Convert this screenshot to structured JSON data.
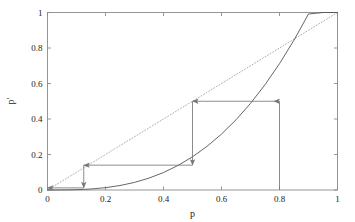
{
  "chart_data": {
    "type": "line",
    "title": "",
    "subtitle": "",
    "xlabel": "p",
    "ylabel": "p'",
    "xlim": [
      0,
      1
    ],
    "ylim": [
      0,
      1
    ],
    "grid": false,
    "legend": "none",
    "xticks": [
      {
        "value": 0,
        "label": "0"
      },
      {
        "value": 0.2,
        "label": "0.2"
      },
      {
        "value": 0.4,
        "label": "0.4"
      },
      {
        "value": 0.6,
        "label": "0.6"
      },
      {
        "value": 0.8,
        "label": "0.8"
      },
      {
        "value": 1,
        "label": "1"
      }
    ],
    "yticks": [
      {
        "value": 0,
        "label": "0"
      },
      {
        "value": 0.2,
        "label": "0.2"
      },
      {
        "value": 0.4,
        "label": "0.4"
      },
      {
        "value": 0.6,
        "label": "0.6"
      },
      {
        "value": 0.8,
        "label": "0.8"
      },
      {
        "value": 1,
        "label": "1"
      }
    ],
    "series": [
      {
        "name": "identity-line",
        "style": "dotted",
        "color": "#999999",
        "x": [
          0,
          1
        ],
        "values": [
          0,
          1
        ]
      },
      {
        "name": "map-curve",
        "style": "solid",
        "color": "#555555",
        "x": [
          0,
          0.05,
          0.1,
          0.125,
          0.15,
          0.2,
          0.25,
          0.3,
          0.35,
          0.4,
          0.45,
          0.5,
          0.55,
          0.6,
          0.65,
          0.7,
          0.75,
          0.8,
          0.85,
          0.9,
          0.95,
          1
        ],
        "values": [
          0,
          0.0003,
          0.0018,
          0.0034,
          0.0057,
          0.0132,
          0.0252,
          0.0428,
          0.0669,
          0.0985,
          0.1383,
          0.1871,
          0.2458,
          0.315,
          0.3955,
          0.488,
          0.5932,
          0.7117,
          0.8443,
          0.9915,
          1.0,
          1.0
        ]
      }
    ],
    "cobweb": {
      "color": "#777777",
      "start": {
        "x": 0.8,
        "y": 0.0
      },
      "steps": [
        {
          "kind": "vertical",
          "x": 0.8,
          "from_y": 0.0,
          "to_y": 0.5,
          "arrow": "up"
        },
        {
          "kind": "horizontal",
          "y": 0.5,
          "from_x": 0.8,
          "to_x": 0.5,
          "arrow": "left"
        },
        {
          "kind": "vertical",
          "x": 0.5,
          "from_y": 0.5,
          "to_y": 0.14,
          "arrow": "down"
        },
        {
          "kind": "horizontal",
          "y": 0.14,
          "from_x": 0.5,
          "to_x": 0.125,
          "arrow": "left"
        },
        {
          "kind": "vertical",
          "x": 0.125,
          "from_y": 0.14,
          "to_y": 0.012,
          "arrow": "down"
        },
        {
          "kind": "horizontal",
          "y": 0.012,
          "from_x": 0.125,
          "to_x": 0.0,
          "arrow": "left"
        }
      ]
    },
    "frame": {
      "border": true,
      "color": "#8a8a8a"
    },
    "background": "#ffffff"
  }
}
